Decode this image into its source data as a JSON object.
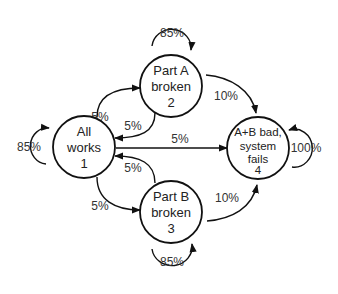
{
  "nodes": [
    {
      "id": 1,
      "lines": [
        "All",
        "works",
        "1"
      ]
    },
    {
      "id": 2,
      "lines": [
        "Part A",
        "broken",
        "2"
      ]
    },
    {
      "id": 3,
      "lines": [
        "Part B",
        "broken",
        "3"
      ]
    },
    {
      "id": 4,
      "lines": [
        "A+B bad,",
        "system",
        "fails",
        "4"
      ]
    }
  ],
  "edges": {
    "n1_self": "85%",
    "n2_self": "85%",
    "n3_self": "85%",
    "n4_self": "100%",
    "n1_to_n2": "5%",
    "n2_to_n1": "5%",
    "n1_to_n3": "5%",
    "n3_to_n1": "5%",
    "n1_to_n4": "5%",
    "n2_to_n4": "10%",
    "n3_to_n4": "10%"
  },
  "colors": {
    "stroke": "#111111",
    "text": "#222222",
    "background": "#ffffff"
  }
}
